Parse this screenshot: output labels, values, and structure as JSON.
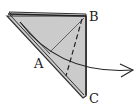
{
  "diagram": {
    "type": "origami-fold-step",
    "labels": {
      "a": "A",
      "b": "B",
      "c": "C"
    },
    "colors": {
      "paper_fill": "#cfcfcf",
      "line": "#333333",
      "background": "#ffffff"
    },
    "elements": [
      "folded-triangle",
      "valley-fold-dashed-line",
      "crease-line",
      "curved-fold-arrow"
    ]
  }
}
